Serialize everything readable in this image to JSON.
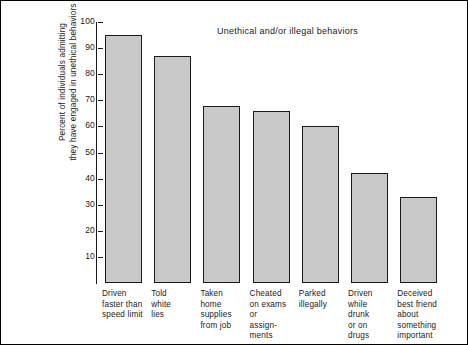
{
  "chart_data": {
    "type": "bar",
    "title": "Unethical and/or illegal behaviors",
    "xlabel": "",
    "ylabel": "Percent of individuals admitting they have engaged in unethical behaviors",
    "ylabel_lines": [
      "Percent of individuals admitting",
      "they have engaged in unethical behaviors"
    ],
    "ylim": [
      0,
      100
    ],
    "yticks": [
      100,
      90,
      80,
      70,
      60,
      50,
      40,
      30,
      20,
      10
    ],
    "ytick_labels": [
      "100",
      "90",
      "80",
      "70",
      "60",
      "50",
      "40",
      "30",
      "20",
      "10"
    ],
    "grid": false,
    "legend": "none",
    "categories": [
      "Driven faster than speed limit",
      "Told white lies",
      "Taken home supplies from job",
      "Cheated on exams or assign-ments",
      "Parked illegally",
      "Driven while drunk or on drugs",
      "Deceived best friend about something important"
    ],
    "category_label_lines": [
      [
        "Driven",
        "faster than",
        "speed limit"
      ],
      [
        "Told",
        "white",
        "lies"
      ],
      [
        "Taken",
        "home",
        "supplies",
        "from job"
      ],
      [
        "Cheated",
        "on exams",
        "or",
        "assign-",
        "ments"
      ],
      [
        "Parked",
        "illegally"
      ],
      [
        "Driven",
        "while",
        "drunk",
        "or on",
        "drugs"
      ],
      [
        "Deceived",
        "best friend",
        "about",
        "something",
        "important"
      ]
    ],
    "values": [
      95,
      87,
      68,
      66,
      60,
      42,
      33
    ],
    "bar_color": "#c9c9c9",
    "bar_edge_color": "#1a1a1a",
    "background_color": "#ffffff",
    "frame_color": "#000000"
  }
}
